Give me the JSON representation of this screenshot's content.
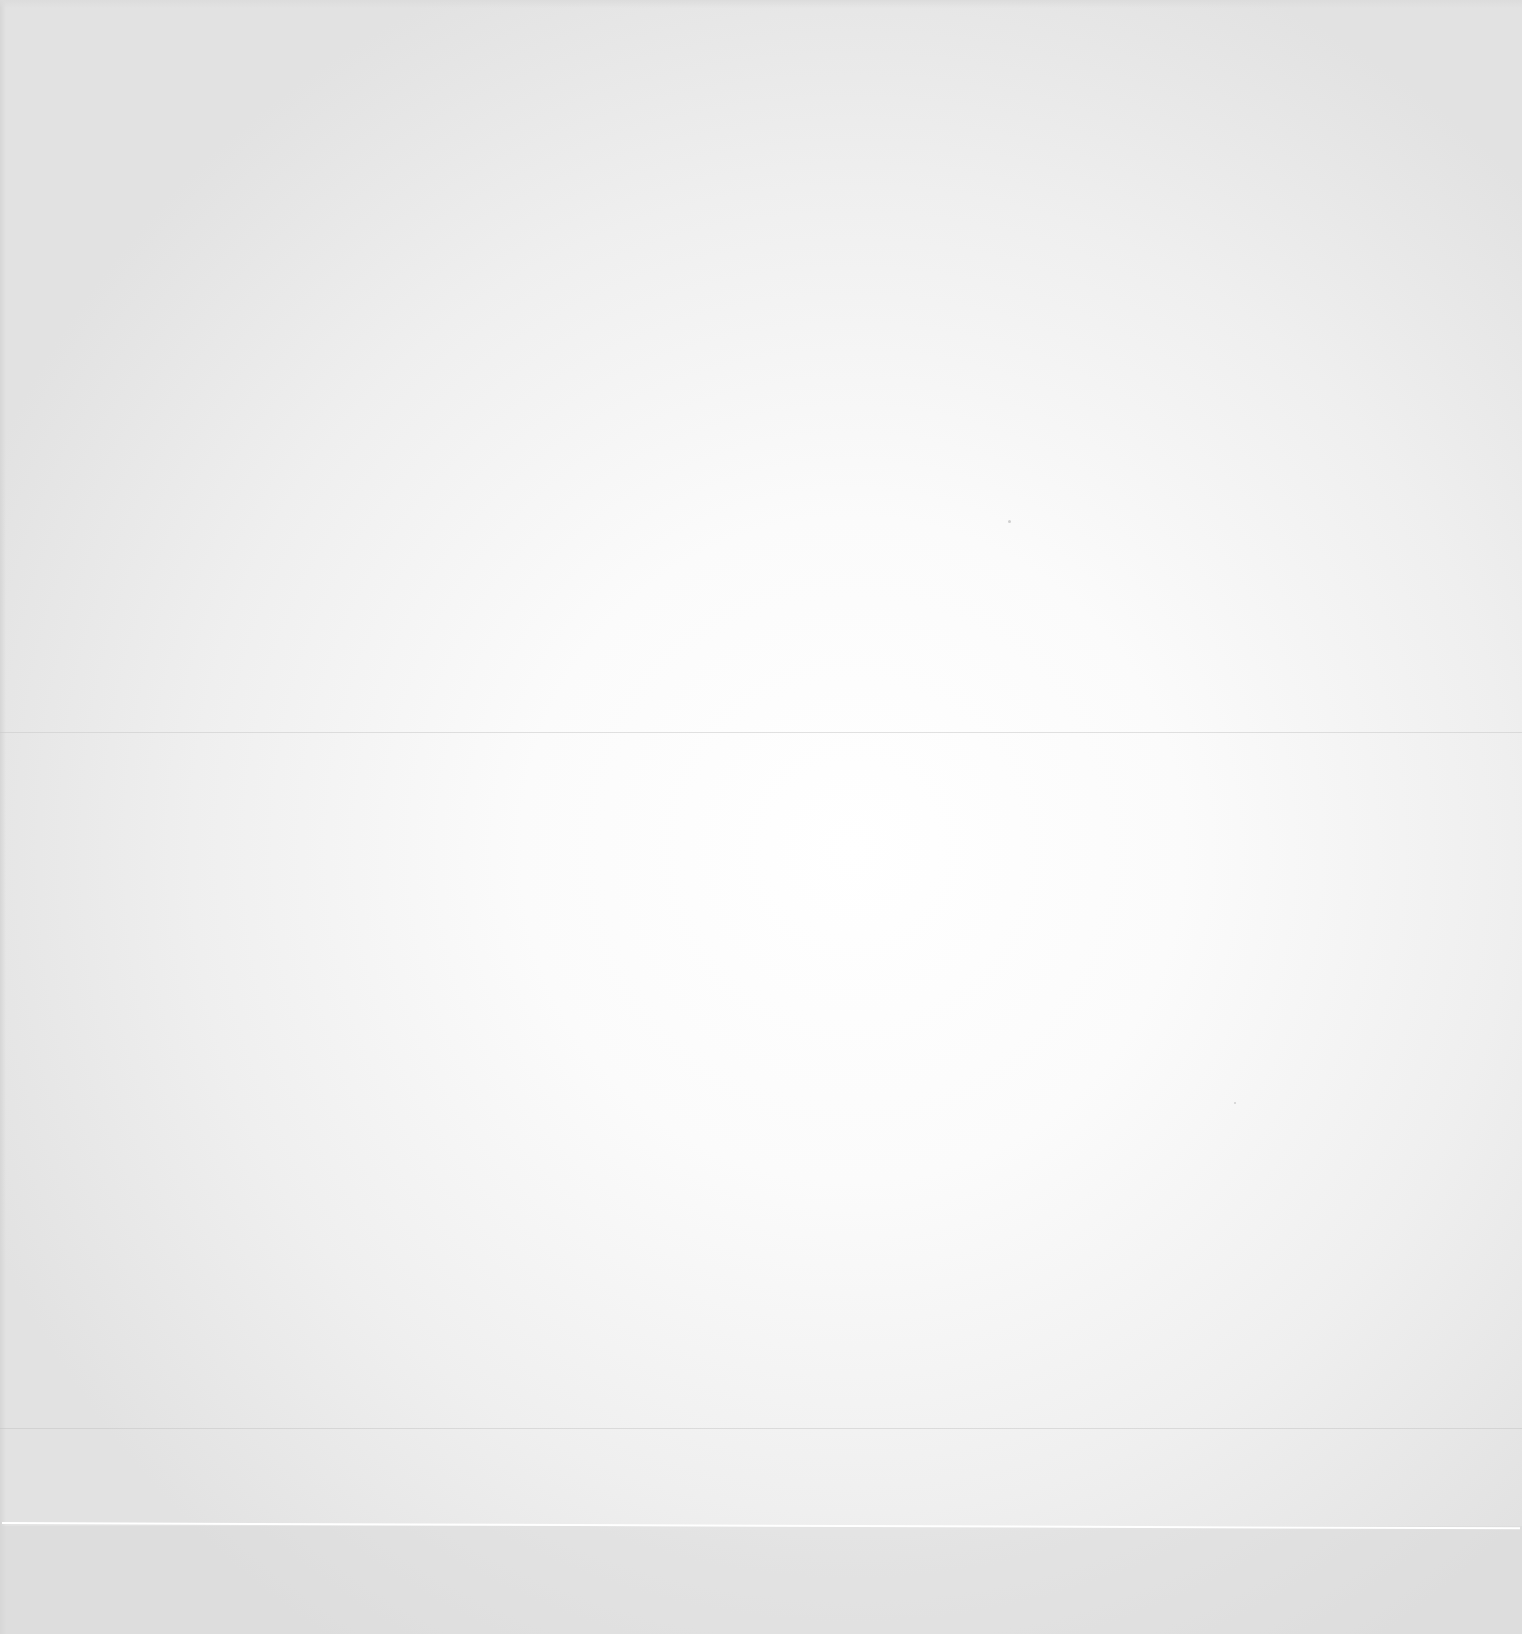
{
  "document": {
    "type": "blank scanned page",
    "text_content": "",
    "colors": {
      "paper_center": "#ffffff",
      "paper_edge": "#e2e2e2",
      "fold_line": "#c8c8c8",
      "scan_seam": "#ffffff"
    }
  }
}
